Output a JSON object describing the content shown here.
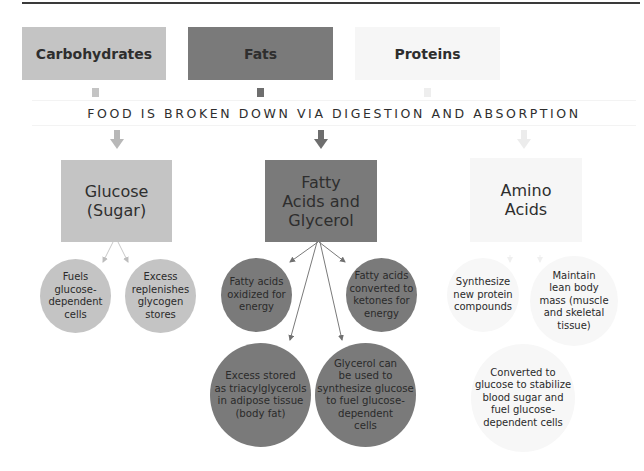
{
  "diagram": {
    "banner": "FOOD IS BROKEN DOWN VIA DIGESTION AND ABSORPTION",
    "colors": {
      "carbohydrates": "#c4c4c4",
      "fats": "#7a7a7a",
      "proteins": "#f5f5f5",
      "fats_dark_connector": "#6e6e6e",
      "arrow_light": "#b4b4b4"
    },
    "columns": [
      {
        "source": "Carbohydrates",
        "product": "Glucose\n(Sugar)",
        "outcomes": [
          "Fuels\nglucose-\ndependent\ncells",
          "Excess\nreplenishes\nglycogen\nstores"
        ]
      },
      {
        "source": "Fats",
        "product": "Fatty\nAcids and\nGlycerol",
        "outcomes": [
          "Fatty acids\noxidized for\nenergy",
          "Fatty acids\nconverted to\nketones for\nenergy",
          "Excess stored\nas triacylglycerols\nin adipose tissue\n(body fat)",
          "Glycerol can\nbe used to\nsynthesize glucose\nto fuel glucose-\ndependent\ncells"
        ]
      },
      {
        "source": "Proteins",
        "product": "Amino\nAcids",
        "outcomes": [
          "Synthesize\nnew protein\ncompounds",
          "Maintain\nlean body\nmass (muscle\nand skeletal\ntissue)",
          "Converted to\nglucose to stabilize\nblood sugar and\nfuel glucose-\ndependent cells"
        ]
      }
    ]
  }
}
